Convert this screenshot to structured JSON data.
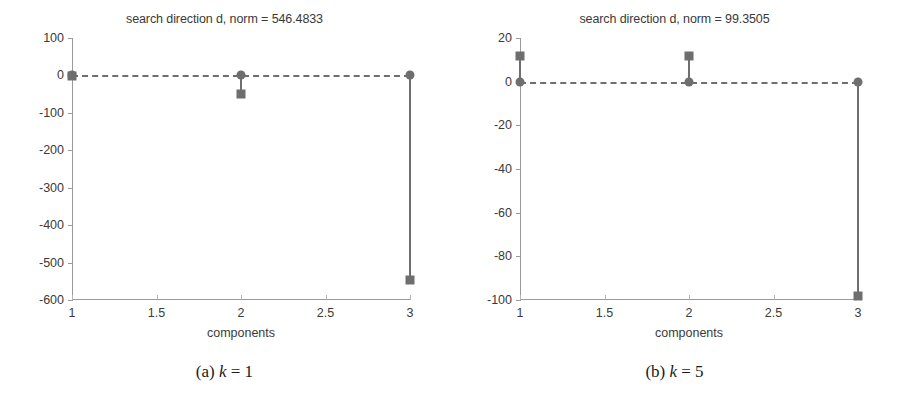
{
  "figure": {
    "width": 899,
    "height": 410,
    "background": "#ffffff",
    "accent": "#6e6e6e",
    "axis_color": "#9a9a9a",
    "text_color": "#3a3a3a"
  },
  "subfigures": [
    {
      "key": "a",
      "caption_label": "(a)",
      "caption_var": "k",
      "caption_eq": "= 1",
      "caption_full": "(a) k = 1"
    },
    {
      "key": "b",
      "caption_label": "(b)",
      "caption_var": "k",
      "caption_eq": "= 5",
      "caption_full": "(b) k = 5"
    }
  ],
  "chart_data": [
    {
      "type": "bar",
      "subplot": "a",
      "title": "search direction d, norm = 546.4833",
      "xlabel": "components",
      "ylabel": "",
      "x": [
        1,
        2,
        3
      ],
      "categories": [
        "1",
        "2",
        "3"
      ],
      "values": [
        -0.5,
        -50,
        -546.4
      ],
      "xlim": [
        1,
        3
      ],
      "ylim": [
        -600,
        100
      ],
      "xticks": [
        1,
        1.5,
        2,
        2.5,
        3
      ],
      "xticklabels": [
        "1",
        "1.5",
        "2",
        "2.5",
        "3"
      ],
      "yticks": [
        100,
        0,
        -100,
        -200,
        -300,
        -400,
        -500,
        -600
      ],
      "yticklabels": [
        "100",
        "0",
        "-100",
        "-200",
        "-300",
        "-400",
        "-500",
        "-600"
      ],
      "baseline": 0,
      "grid": false,
      "legend": null,
      "marker": "square",
      "style": "stem"
    },
    {
      "type": "bar",
      "subplot": "b",
      "title": "search direction d, norm = 99.3505",
      "xlabel": "components",
      "ylabel": "",
      "x": [
        1,
        2,
        3
      ],
      "categories": [
        "1",
        "2",
        "3"
      ],
      "values": [
        11.8,
        11.8,
        -98.0
      ],
      "xlim": [
        1,
        3
      ],
      "ylim": [
        -100,
        20
      ],
      "xticks": [
        1,
        1.5,
        2,
        2.5,
        3
      ],
      "xticklabels": [
        "1",
        "1.5",
        "2",
        "2.5",
        "3"
      ],
      "yticks": [
        20,
        0,
        -20,
        -40,
        -60,
        -80,
        -100
      ],
      "yticklabels": [
        "20",
        "0",
        "-20",
        "-40",
        "-60",
        "-80",
        "-100"
      ],
      "baseline": 0,
      "grid": false,
      "legend": null,
      "marker": "square",
      "style": "stem"
    }
  ]
}
